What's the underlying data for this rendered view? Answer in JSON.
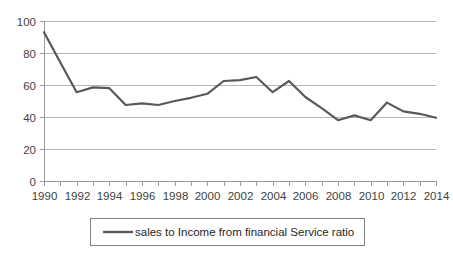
{
  "chart_data": {
    "type": "line",
    "title": "",
    "xlabel": "",
    "ylabel": "",
    "ylim": [
      0,
      100
    ],
    "xlim": [
      1990,
      2014
    ],
    "ytick_step": 20,
    "yticks": [
      "0",
      "20",
      "40",
      "60",
      "80",
      "100"
    ],
    "grid": "horizontal",
    "legend_position": "bottom",
    "line_color": "#595959",
    "gridline_color": "#b7b7b7",
    "axis_color": "#9a9a9a",
    "x": [
      1990,
      1991,
      1992,
      1993,
      1994,
      1995,
      1996,
      1997,
      1998,
      1999,
      2000,
      2001,
      2002,
      2003,
      2004,
      2005,
      2006,
      2007,
      2008,
      2009,
      2010,
      2011,
      2012,
      2013,
      2014
    ],
    "xtick_labels": [
      "1990",
      "",
      "1992",
      "",
      "1994",
      "",
      "1996",
      "",
      "1998",
      "",
      "2000",
      "",
      "2002",
      "",
      "2004",
      "",
      "2006",
      "",
      "2008",
      "",
      "2010",
      "",
      "2012",
      "",
      "2014"
    ],
    "xtick_labels_shown": [
      "1990",
      "1992",
      "1994",
      "1996",
      "1998",
      "2000",
      "2002",
      "2004",
      "2006",
      "2008",
      "2010",
      "2012",
      "2014"
    ],
    "series": [
      {
        "name": "sales to Income from financial Service ratio",
        "values": [
          93.0,
          74.0,
          55.5,
          58.5,
          58.0,
          47.5,
          48.5,
          47.5,
          50.0,
          52.0,
          54.5,
          62.5,
          63.0,
          65.0,
          55.5,
          62.5,
          52.5,
          45.5,
          38.0,
          41.0,
          38.0,
          49.0,
          43.5,
          42.0,
          39.5
        ]
      }
    ]
  },
  "legend": {
    "entries": [
      {
        "label": "sales to Income from financial Service ratio",
        "color": "#595959"
      }
    ]
  }
}
